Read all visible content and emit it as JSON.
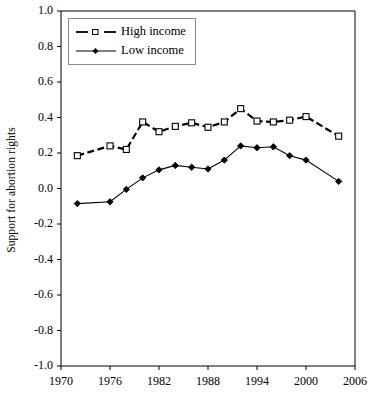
{
  "chart_data": {
    "type": "line",
    "title": "",
    "xlabel": "",
    "ylabel": "Support for abortion rights",
    "xlim": [
      1970,
      2006
    ],
    "ylim": [
      -1.0,
      1.0
    ],
    "grid": false,
    "legend_position": "top-left",
    "xticks": [
      1970,
      1976,
      1982,
      1988,
      1994,
      2000,
      2006
    ],
    "xtick_labels": [
      "1970",
      "1976",
      "1982",
      "1988",
      "1994",
      "2000",
      "2006"
    ],
    "yticks": [
      1.0,
      0.8,
      0.6,
      0.4,
      0.2,
      0.0,
      -0.2,
      -0.4,
      -0.6,
      -0.8,
      -1.0
    ],
    "ytick_labels": [
      "1.0",
      "0.8",
      "0.6",
      "0.4",
      "0.2",
      "0.0",
      "-0.2",
      "-0.4",
      "-0.6",
      "-0.8",
      "-1.0"
    ],
    "x": [
      1972,
      1976,
      1978,
      1980,
      1982,
      1984,
      1986,
      1988,
      1990,
      1992,
      1994,
      1996,
      1998,
      2000,
      2004
    ],
    "series": [
      {
        "name": "High income",
        "marker": "open-square",
        "line_style": "dashed",
        "color": "#000000",
        "values": [
          0.185,
          0.24,
          0.22,
          0.375,
          0.32,
          0.35,
          0.37,
          0.345,
          0.375,
          0.45,
          0.38,
          0.375,
          0.385,
          0.405,
          0.295
        ]
      },
      {
        "name": "Low income",
        "marker": "filled-diamond",
        "line_style": "solid",
        "color": "#000000",
        "values": [
          -0.085,
          -0.075,
          -0.005,
          0.06,
          0.105,
          0.13,
          0.12,
          0.11,
          0.16,
          0.24,
          0.23,
          0.235,
          0.185,
          0.16,
          0.04
        ]
      }
    ]
  },
  "legend": {
    "items": [
      {
        "label": "High income"
      },
      {
        "label": "Low income"
      }
    ]
  },
  "caption": {
    "partial_text": ""
  }
}
